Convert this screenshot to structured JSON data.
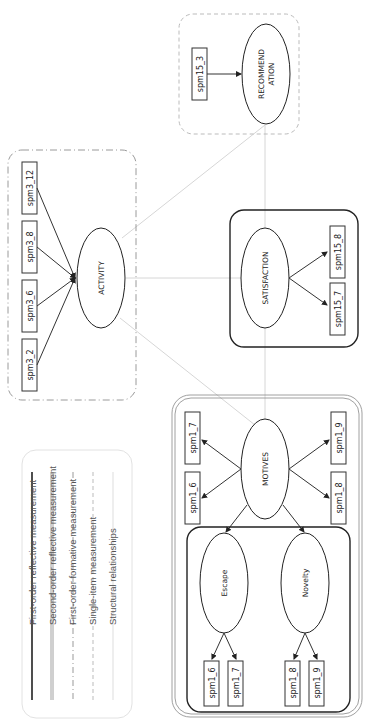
{
  "legend": {
    "items": [
      {
        "label": "First-order reflective measurement",
        "style": "solid-black"
      },
      {
        "label": "Second-order reflective measurement",
        "style": "double-gray"
      },
      {
        "label": "First-order formative measurement",
        "style": "dash-dot-gray"
      },
      {
        "label": "Single-item measurement",
        "style": "dashed-light-gray"
      },
      {
        "label": "Structural  relationships",
        "style": "thin-light-gray"
      }
    ]
  },
  "constructs": {
    "motives": {
      "label": "MOTIVES",
      "indicators": [
        "spm1_6",
        "spm1_7",
        "spm1_8",
        "spm1_9"
      ]
    },
    "escape": {
      "label": "Escape",
      "indicators": [
        "spm1_6",
        "spm1_7"
      ]
    },
    "novelty": {
      "label": "Novelty",
      "indicators": [
        "spm1_8",
        "spm1_9"
      ]
    },
    "activity": {
      "label": "ACTIVITY",
      "indicators": [
        "spm3_2",
        "spm3_6",
        "spm3_8",
        "spm3_12"
      ]
    },
    "satisfaction": {
      "label": "SATISFACTION",
      "indicators": [
        "spm15_7",
        "spm15_8"
      ]
    },
    "recommendation": {
      "label_line1": "RECOMMEND",
      "label_line2": "ATION",
      "indicators": [
        "spm15_3"
      ]
    }
  },
  "colors": {
    "reflective": "#222222",
    "second_order": "#888888",
    "formative": "#9a9a9a",
    "single_item": "#bbbbbb",
    "structural": "#d6d6d6"
  }
}
